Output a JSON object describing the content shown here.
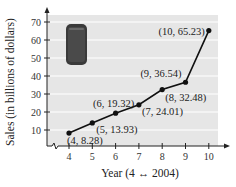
{
  "chart_data": {
    "type": "line",
    "title": "",
    "xlabel": "Year (4 ↔ 2004)",
    "ylabel": "Sales (in billions of dollars)",
    "x": [
      4,
      5,
      6,
      7,
      8,
      9,
      10
    ],
    "series": [
      {
        "name": "Sales",
        "values": [
          8.28,
          13.93,
          19.32,
          24.01,
          32.48,
          36.54,
          65.23
        ]
      }
    ],
    "point_labels": [
      "(4, 8.28)",
      "(5, 13.93)",
      "(6, 19.32)",
      "(7, 24.01)",
      "(8, 32.48)",
      "(9, 36.54)",
      "(10, 65.23)"
    ],
    "x_ticks": [
      "4",
      "5",
      "6",
      "7",
      "8",
      "9",
      "10"
    ],
    "y_ticks": [
      "10",
      "20",
      "30",
      "40",
      "50",
      "60",
      "70"
    ],
    "xlim": [
      3.1,
      10.8
    ],
    "ylim": [
      0,
      75
    ],
    "grid": "horizontal",
    "axis_break": "x-axis",
    "legend": "none",
    "annotation_icon": "smartphone-image",
    "colors": {
      "plot_bg": "#e6e6e6",
      "grid": "#ffffff",
      "line": "#111111",
      "phone": "#3a3a3a"
    }
  }
}
